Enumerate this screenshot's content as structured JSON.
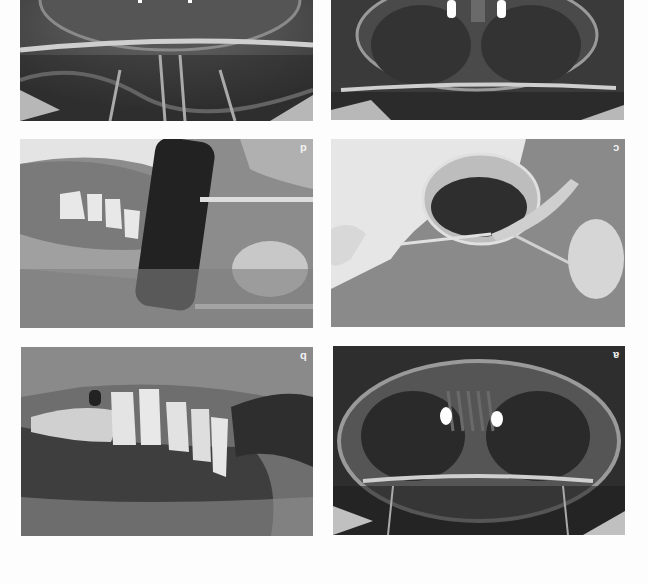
{
  "figure": {
    "orientation": "rotated 180 degrees",
    "panels": [
      {
        "id": "top-left",
        "label": "",
        "type": "panoramic radiograph (partial, cropped)"
      },
      {
        "id": "top-right",
        "label": "",
        "type": "panoramic radiograph (partial, cropped) with two implants"
      },
      {
        "id": "d",
        "label": "d",
        "type": "intraoral clinical photo with membrane and forceps"
      },
      {
        "id": "c",
        "label": "c",
        "type": "bone graft material in metal bowl with forceps"
      },
      {
        "id": "b",
        "label": "b",
        "type": "intraoral photo of restored maxillary teeth"
      },
      {
        "id": "a",
        "label": "a",
        "type": "panoramic radiograph with two implants"
      }
    ]
  },
  "colors": {
    "background": "#fdfdfd",
    "xray_dark": "#2a2a2a",
    "xray_bone": "#bdbdbd",
    "implant": "#ffffff",
    "photo_gray": "#8a8a8a",
    "label": "#f2f2f2"
  }
}
